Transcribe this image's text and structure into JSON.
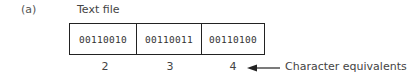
{
  "diagram": {
    "panel_label": "(a)",
    "title": "Text file",
    "bytes": [
      {
        "binary": "00110010",
        "character": "2"
      },
      {
        "binary": "00110011",
        "character": "3"
      },
      {
        "binary": "00110100",
        "character": "4"
      }
    ],
    "annotation": "Character equivalents",
    "arrow_icon": "left-arrow-icon"
  }
}
